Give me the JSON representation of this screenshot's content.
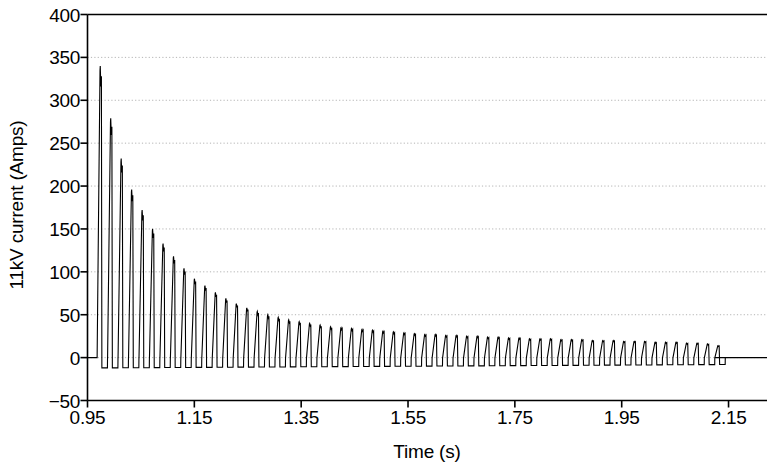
{
  "chart_data": {
    "type": "line",
    "title": "",
    "xlabel": "Time (s)",
    "ylabel": "11kV current (Amps)",
    "xlim": [
      0.95,
      2.222
    ],
    "ylim": [
      -50,
      400
    ],
    "xticks": [
      "0.95",
      "1.15",
      "1.35",
      "1.55",
      "1.75",
      "1.95",
      "2.15"
    ],
    "xtick_values": [
      0.95,
      1.15,
      1.35,
      1.55,
      1.75,
      1.95,
      2.15
    ],
    "yticks": [
      "−50",
      "0",
      "50",
      "100",
      "150",
      "200",
      "250",
      "300",
      "350",
      "400"
    ],
    "ytick_values": [
      -50,
      0,
      50,
      100,
      150,
      200,
      250,
      300,
      350,
      400
    ],
    "grid": "horizontal-dotted",
    "grid_color": "#b4b4b4",
    "line_color": "#000000",
    "line_width": 1.1,
    "legend": null,
    "series": [
      {
        "name": "11kV current",
        "description": "Decaying train of unidirectional current pulses following switching event",
        "quiescent_before_s": 0.968,
        "quiescent_after_s": 2.124,
        "pulse_period_s": 0.0196,
        "pulse_rise_fraction": 0.3,
        "pulse_undershoot_amps": -12,
        "peak_amps": [
          340,
          279,
          232,
          196,
          172,
          150,
          133,
          118,
          104,
          92,
          84,
          76,
          69,
          63,
          58,
          54,
          50,
          47,
          44,
          42,
          40,
          38,
          36,
          35,
          34,
          33,
          32,
          31,
          30,
          29,
          28,
          27,
          27,
          26,
          26,
          25,
          25,
          24,
          24,
          23,
          23,
          22,
          22,
          22,
          21,
          21,
          21,
          20,
          20,
          20,
          19,
          19,
          19,
          18,
          18,
          18,
          17,
          17,
          16,
          14
        ],
        "first_peak_time_s": 0.973,
        "first_peak_amps": 340,
        "last_peak_amps": 14
      }
    ],
    "axes": {
      "top_spine": true,
      "bottom_spine": true,
      "left_spine": true,
      "right_spine": false,
      "tick_direction": "out"
    }
  }
}
